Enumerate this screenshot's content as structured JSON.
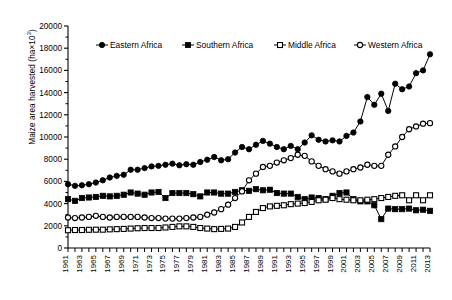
{
  "chart_data": {
    "type": "line",
    "title": "",
    "xlabel": "",
    "ylabel": "Maize area harvested (ha×10³)",
    "ylabel_base": "Maize area harvested (ha×10",
    "ylabel_sup": "3",
    "ylabel_tail": ")",
    "ylim": [
      0,
      20000
    ],
    "ytick_step": 2000,
    "yticks": [
      0,
      2000,
      4000,
      6000,
      8000,
      10000,
      12000,
      14000,
      16000,
      18000,
      20000
    ],
    "xlim": [
      1961,
      2013
    ],
    "xticks_all_years": true,
    "grid": false,
    "legend_position": "top-center",
    "x": [
      1961,
      1962,
      1963,
      1964,
      1965,
      1966,
      1967,
      1968,
      1969,
      1970,
      1971,
      1972,
      1973,
      1974,
      1975,
      1976,
      1977,
      1978,
      1979,
      1980,
      1981,
      1982,
      1983,
      1984,
      1985,
      1986,
      1987,
      1988,
      1989,
      1990,
      1991,
      1992,
      1993,
      1994,
      1995,
      1996,
      1997,
      1998,
      1999,
      2000,
      2001,
      2002,
      2003,
      2004,
      2005,
      2006,
      2007,
      2008,
      2009,
      2010,
      2011,
      2012,
      2013
    ],
    "xtick_labels": [
      "1961",
      "1962",
      "1963",
      "1964",
      "1965",
      "1966",
      "1967",
      "1968",
      "1969",
      "1970",
      "1971",
      "1972",
      "1973",
      "1974",
      "1975",
      "1976",
      "1977",
      "1978",
      "1979",
      "1980",
      "1981",
      "1982",
      "1983",
      "1984",
      "1985",
      "1986",
      "1987",
      "1988",
      "1989",
      "1990",
      "1991",
      "1992",
      "1993",
      "1994",
      "1995",
      "1996",
      "1997",
      "1998",
      "1999",
      "2000",
      "2001",
      "2002",
      "2003",
      "2004",
      "2005",
      "2006",
      "2007",
      "2008",
      "2009",
      "2010",
      "2011",
      "2012",
      "2013"
    ],
    "xtick_labels_shown": [
      "1961",
      "1963",
      "1965",
      "1967",
      "1969",
      "1971",
      "1973",
      "1975",
      "1977",
      "1979",
      "1981",
      "1983",
      "1985",
      "1987",
      "1989",
      "1991",
      "1993",
      "1995",
      "1997",
      "1999",
      "2001",
      "2003",
      "2005",
      "2007",
      "2009",
      "2011",
      "2013"
    ],
    "series": [
      {
        "name": "Eastern Africa",
        "marker": "filled-circle",
        "color": "#000000",
        "values": [
          5750,
          5600,
          5650,
          5750,
          5900,
          6100,
          6350,
          6500,
          6600,
          7050,
          7050,
          7200,
          7350,
          7400,
          7500,
          7600,
          7450,
          7550,
          7500,
          7750,
          7950,
          8200,
          7900,
          8000,
          8600,
          9100,
          8900,
          9300,
          9650,
          9400,
          9100,
          8900,
          9200,
          8900,
          9500,
          10150,
          9750,
          9600,
          9700,
          9600,
          10100,
          10400,
          11400,
          13600,
          12900,
          13900,
          12350,
          14800,
          14300,
          14550,
          15750,
          16000,
          17450
        ]
      },
      {
        "name": "Southern Africa",
        "marker": "filled-square",
        "color": "#000000",
        "values": [
          4400,
          4250,
          4500,
          4550,
          4600,
          4700,
          4650,
          4700,
          4800,
          5000,
          4900,
          4800,
          5000,
          5050,
          4500,
          4950,
          4950,
          4950,
          4850,
          4650,
          5000,
          5000,
          4900,
          4900,
          5050,
          5200,
          5150,
          5300,
          5200,
          5250,
          4950,
          4900,
          4900,
          4600,
          4400,
          4550,
          4500,
          4400,
          4700,
          4950,
          5000,
          4400,
          4200,
          4200,
          3850,
          2600,
          3550,
          3500,
          3500,
          3550,
          3400,
          3450,
          3350
        ]
      },
      {
        "name": "Middle Africa",
        "marker": "open-square",
        "color": "#000000",
        "values": [
          1600,
          1620,
          1620,
          1640,
          1650,
          1650,
          1680,
          1700,
          1720,
          1750,
          1780,
          1800,
          1800,
          1800,
          1850,
          1900,
          1950,
          1950,
          1900,
          1800,
          1750,
          1700,
          1720,
          1750,
          1900,
          2300,
          2800,
          3250,
          3600,
          3750,
          3800,
          3850,
          3950,
          4000,
          4050,
          4150,
          4300,
          4350,
          4500,
          4400,
          4350,
          4300,
          4300,
          4350,
          4400,
          4500,
          4600,
          4700,
          4750,
          4300,
          4750,
          4300,
          4750
        ]
      },
      {
        "name": "Western Africa",
        "marker": "open-circle",
        "color": "#000000",
        "values": [
          2750,
          2700,
          2750,
          2800,
          2900,
          2800,
          2750,
          2800,
          2800,
          2800,
          2800,
          2750,
          2700,
          2700,
          2650,
          2650,
          2650,
          2700,
          2750,
          2800,
          3000,
          3200,
          3500,
          3900,
          4500,
          5100,
          6100,
          6700,
          7300,
          7400,
          7700,
          7900,
          8100,
          8400,
          8300,
          7800,
          7400,
          7100,
          6900,
          6700,
          6900,
          7100,
          7250,
          7500,
          7400,
          7400,
          8400,
          9150,
          10000,
          10700,
          10950,
          11200,
          11250
        ]
      }
    ],
    "legend": [
      {
        "label": "Eastern Africa",
        "marker": "filled-circle"
      },
      {
        "label": "Southern Africa",
        "marker": "filled-square"
      },
      {
        "label": "Middle Africa",
        "marker": "open-square"
      },
      {
        "label": "Western Africa",
        "marker": "open-circle"
      }
    ]
  }
}
